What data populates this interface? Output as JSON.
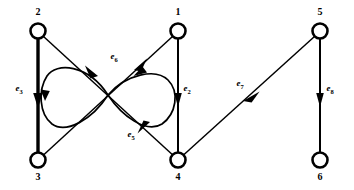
{
  "figure": {
    "kind": "directed-graph",
    "background_color": "#ffffff",
    "stroke_color": "#000000",
    "width": 354,
    "height": 190
  },
  "nodes": [
    {
      "id": "n2",
      "label": "2",
      "cx": 38,
      "cy": 31,
      "r": 7.5,
      "label_x": 38,
      "label_y": 15
    },
    {
      "id": "n1",
      "label": "1",
      "cx": 178,
      "cy": 31,
      "r": 7.5,
      "label_x": 178,
      "label_y": 15
    },
    {
      "id": "n5",
      "label": "5",
      "cx": 320,
      "cy": 31,
      "r": 7.5,
      "label_x": 320,
      "label_y": 15
    },
    {
      "id": "n3",
      "label": "3",
      "cx": 38,
      "cy": 160,
      "r": 7.5,
      "label_x": 38,
      "label_y": 180
    },
    {
      "id": "n4",
      "label": "4",
      "cx": 178,
      "cy": 160,
      "r": 7.5,
      "label_x": 178,
      "label_y": 180
    },
    {
      "id": "n6",
      "label": "6",
      "cx": 320,
      "cy": 160,
      "r": 7.5,
      "label_x": 320,
      "label_y": 180
    }
  ],
  "edges": [
    {
      "id": "e3",
      "label_base": "e",
      "label_sub": "3",
      "from": "2",
      "to": "3",
      "label_x": 19,
      "label_y": 91,
      "weight": "thick"
    },
    {
      "id": "e2",
      "label_base": "e",
      "label_sub": "2",
      "from": "1",
      "to": "4",
      "label_x": 187,
      "label_y": 91,
      "weight": "med"
    },
    {
      "id": "e8",
      "label_base": "e",
      "label_sub": "8",
      "from": "5",
      "to": "6",
      "label_x": 329,
      "label_y": 91,
      "weight": "med"
    },
    {
      "id": "e7",
      "label_base": "e",
      "label_sub": "7",
      "from": "5",
      "to": "4",
      "label_x": 239,
      "label_y": 85,
      "weight": "thin"
    },
    {
      "id": "e6",
      "label_base": "e",
      "label_sub": "6",
      "from": "2",
      "to": "1",
      "label_x": 114,
      "label_y": 58,
      "weight": "thin"
    },
    {
      "id": "e5",
      "label_base": "e",
      "label_sub": "5",
      "from": "1",
      "to": "4",
      "label_x": 131,
      "label_y": 136,
      "weight": "thin"
    }
  ],
  "loops": [
    {
      "id": "loop-left",
      "description": "left lobe of figure-eight at crossing point"
    },
    {
      "id": "loop-right",
      "description": "right lobe of figure-eight at crossing point"
    }
  ],
  "crossing_point": {
    "x": 108,
    "y": 95
  }
}
